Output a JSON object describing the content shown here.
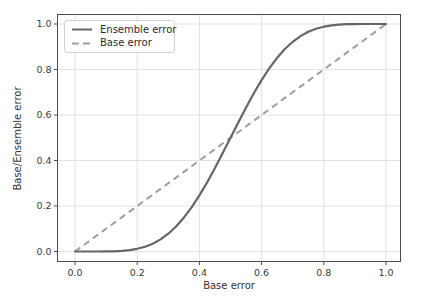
{
  "chart_data": {
    "type": "line",
    "title": "",
    "xlabel": "Base error",
    "ylabel": "Base/Ensemble error",
    "xlim": [
      0,
      1
    ],
    "ylim": [
      0,
      1
    ],
    "grid": true,
    "legend_position": "upper left",
    "xticks": {
      "values": [
        0,
        0.2,
        0.4,
        0.6,
        0.8,
        1.0
      ],
      "labels": [
        "0.0",
        "0.2",
        "0.4",
        "0.6",
        "0.8",
        "1.0"
      ]
    },
    "yticks": {
      "values": [
        0,
        0.2,
        0.4,
        0.6,
        0.8,
        1.0
      ],
      "labels": [
        "0.0",
        "0.2",
        "0.4",
        "0.6",
        "0.8",
        "1.0"
      ]
    },
    "series": [
      {
        "name": "Ensemble error",
        "style": "solid",
        "color": "#666666",
        "x": [
          0,
          0.025,
          0.05,
          0.075,
          0.1,
          0.125,
          0.15,
          0.175,
          0.2,
          0.225,
          0.25,
          0.275,
          0.3,
          0.325,
          0.35,
          0.375,
          0.4,
          0.425,
          0.45,
          0.475,
          0.5,
          0.525,
          0.55,
          0.575,
          0.6,
          0.625,
          0.65,
          0.675,
          0.7,
          0.725,
          0.75,
          0.775,
          0.8,
          0.825,
          0.85,
          0.875,
          0.9,
          0.925,
          0.95,
          0.975,
          1
        ],
        "y": [
          0,
          0.0,
          0.0,
          0.0001,
          0.0003,
          0.001,
          0.0027,
          0.0059,
          0.0117,
          0.0208,
          0.0343,
          0.0532,
          0.0782,
          0.11,
          0.1487,
          0.1943,
          0.2465,
          0.3044,
          0.3669,
          0.4326,
          0.5,
          0.5674,
          0.6331,
          0.6956,
          0.7535,
          0.8057,
          0.8513,
          0.89,
          0.9218,
          0.9468,
          0.9657,
          0.9792,
          0.9883,
          0.9941,
          0.9973,
          0.999,
          0.9997,
          0.9999,
          1.0,
          1.0,
          1
        ]
      },
      {
        "name": "Base error",
        "style": "dashed",
        "color": "#9e9e9e",
        "x": [
          0,
          1
        ],
        "y": [
          0,
          1
        ]
      }
    ],
    "colors": {
      "grid": "#e1e1e1",
      "spine": "#4d4d4d",
      "tick_label": "#3a3a3a",
      "axis_label": "#333333",
      "legend_border": "#d2d2d2",
      "background": "#ffffff"
    }
  }
}
